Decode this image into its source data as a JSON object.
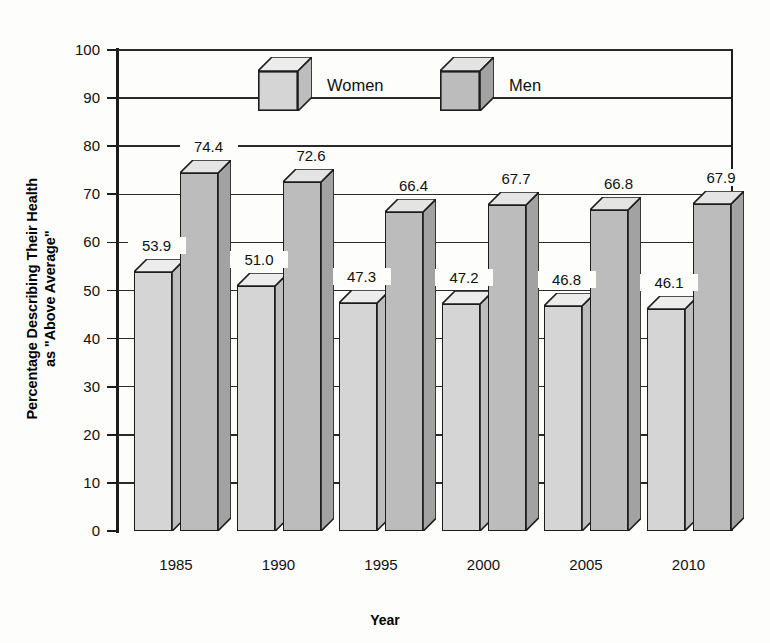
{
  "chart_data": {
    "type": "bar",
    "title": "",
    "subtitle": "",
    "xlabel": "Year",
    "ylabel": "Percentage Describing Their Health\nas \"Above Average\"",
    "categories": [
      "1985",
      "1990",
      "1995",
      "2000",
      "2005",
      "2010"
    ],
    "series": [
      {
        "name": "Women",
        "values": [
          53.9,
          51.0,
          47.3,
          47.2,
          46.8,
          46.1
        ],
        "labels": [
          "53.9",
          "51.0",
          "47.3",
          "47.2",
          "46.8",
          "46.1"
        ],
        "color": "#d5d5d5",
        "side_color": "#bdbdbd",
        "top_color": "#ececec"
      },
      {
        "name": "Men",
        "values": [
          74.4,
          72.6,
          66.4,
          67.7,
          66.8,
          67.9
        ],
        "labels": [
          "74.4",
          "72.6",
          "66.4",
          "67.7",
          "66.8",
          "67.9"
        ],
        "color": "#bcbcbc",
        "side_color": "#a2a2a2",
        "top_color": "#e4e4e4"
      }
    ],
    "ylim": [
      0,
      100
    ],
    "yticks": [
      0,
      10,
      20,
      30,
      40,
      50,
      60,
      70,
      80,
      90,
      100
    ],
    "ytick_labels": [
      "0",
      "10",
      "20",
      "30",
      "40",
      "50",
      "60",
      "70",
      "80",
      "90",
      "100"
    ],
    "grid": true,
    "grid_axis": "y",
    "legend_position": "top-center",
    "legend_entries": [
      "Women",
      "Men"
    ],
    "style": "3d-bar",
    "line_color": "#1d1d1d",
    "background": "#fdfdfb"
  }
}
